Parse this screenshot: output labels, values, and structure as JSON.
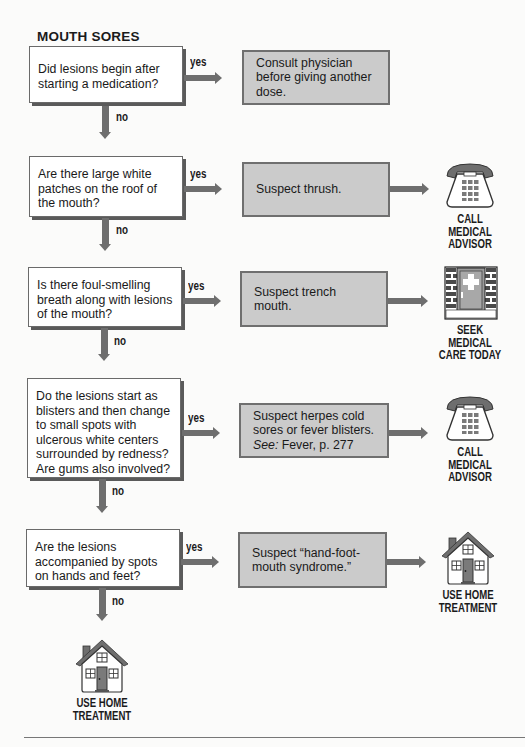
{
  "title": "MOUTH SORES",
  "branch_labels": {
    "yes": "yes",
    "no": "no"
  },
  "steps": [
    {
      "question": "Did lesions begin after starting a medication?",
      "answer": "Consult physician before giving another dose.",
      "outcome": null
    },
    {
      "question": "Are there large white patches on the roof of the mouth?",
      "answer": "Suspect thrush.",
      "outcome": {
        "icon": "telephone-icon",
        "label": [
          "CALL",
          "MEDICAL",
          "ADVISOR"
        ]
      }
    },
    {
      "question": "Is there foul-smelling breath along with lesions of the mouth?",
      "answer": "Suspect trench mouth.",
      "outcome": {
        "icon": "hospital-door-icon",
        "label": [
          "SEEK",
          "MEDICAL",
          "CARE TODAY"
        ]
      }
    },
    {
      "question": "Do the lesions start as blisters and then change to small spots with ulcerous white centers surrounded by redness? Are gums also involved?",
      "answer": "Suspect herpes cold sores or fever blisters.",
      "answer_ref_prefix": "See:",
      "answer_ref": "Fever, p. 277",
      "outcome": {
        "icon": "telephone-icon",
        "label": [
          "CALL",
          "MEDICAL",
          "ADVISOR"
        ]
      }
    },
    {
      "question": "Are the lesions accompanied by spots on hands and feet?",
      "answer": "Suspect “hand-foot-mouth syndrome.”",
      "outcome": {
        "icon": "house-icon",
        "label": [
          "USE HOME",
          "TREATMENT"
        ]
      }
    }
  ],
  "final_outcome": {
    "icon": "house-icon",
    "label": [
      "USE HOME",
      "TREATMENT"
    ]
  },
  "colors": {
    "question_fill": "#ffffff",
    "answer_fill": "#cbcbcb",
    "arrow": "#6e6e6e",
    "shadow": "#5a5a5a"
  }
}
